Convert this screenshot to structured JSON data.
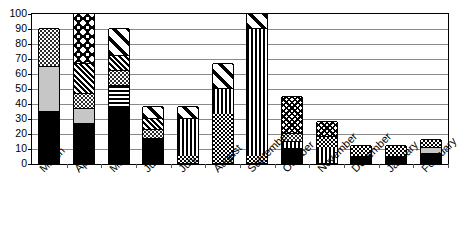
{
  "chart_data": {
    "type": "bar",
    "subtype": "stacked-vertical",
    "title": "",
    "subtitle": "",
    "xlabel": "",
    "ylabel": "",
    "ylim": [
      0,
      100
    ],
    "yticks": [
      0,
      10,
      20,
      30,
      40,
      50,
      60,
      70,
      80,
      90,
      100
    ],
    "ytick_labels": [
      "0",
      "10",
      "20",
      "30",
      "40",
      "50",
      "60",
      "70",
      "80",
      "90",
      "100"
    ],
    "grid": true,
    "grid_axis": "y",
    "legend": false,
    "legend_position": "none",
    "annotations": [],
    "categories": [
      "March",
      "April",
      "May",
      "June",
      "July",
      "August",
      "September",
      "October",
      "November",
      "December",
      "January",
      "February"
    ],
    "series": [
      {
        "name": "segment-1",
        "pattern": "solid-black",
        "values": [
          35,
          27,
          38,
          17,
          5,
          33,
          5,
          10,
          10,
          5,
          5,
          7
        ]
      },
      {
        "name": "segment-2",
        "pattern": "light-gray",
        "values": [
          30,
          10,
          14,
          6,
          25,
          17,
          85,
          5,
          8,
          7,
          7,
          4
        ]
      },
      {
        "name": "segment-3",
        "pattern": "fine-dots",
        "values": [
          25,
          10,
          10,
          7,
          8,
          17,
          10,
          5,
          10,
          0,
          0,
          5
        ]
      },
      {
        "name": "segment-4",
        "pattern": "diagonal-hatch",
        "values": [
          0,
          20,
          10,
          8,
          0,
          0,
          0,
          25,
          0,
          0,
          0,
          0
        ]
      },
      {
        "name": "segment-5",
        "pattern": "star-burst",
        "values": [
          0,
          33,
          18,
          0,
          0,
          0,
          0,
          0,
          0,
          0,
          0,
          0
        ]
      }
    ],
    "totals": [
      90,
      100,
      90,
      38,
      38,
      67,
      100,
      45,
      28,
      12,
      12,
      16
    ],
    "stacks": [
      {
        "category": "March",
        "total": 90,
        "segments": [
          {
            "from": 0,
            "to": 35,
            "pattern": "p-black"
          },
          {
            "from": 35,
            "to": 65,
            "pattern": "p-lightgray"
          },
          {
            "from": 65,
            "to": 90,
            "pattern": "p-dots"
          }
        ]
      },
      {
        "category": "April",
        "total": 100,
        "segments": [
          {
            "from": 0,
            "to": 27,
            "pattern": "p-black"
          },
          {
            "from": 27,
            "to": 37,
            "pattern": "p-lightgray"
          },
          {
            "from": 37,
            "to": 47,
            "pattern": "p-dots"
          },
          {
            "from": 47,
            "to": 67,
            "pattern": "p-diag-dense"
          },
          {
            "from": 67,
            "to": 100,
            "pattern": "p-star"
          }
        ]
      },
      {
        "category": "May",
        "total": 90,
        "segments": [
          {
            "from": 0,
            "to": 38,
            "pattern": "p-black"
          },
          {
            "from": 38,
            "to": 52,
            "pattern": "p-hstripe"
          },
          {
            "from": 52,
            "to": 62,
            "pattern": "p-dots"
          },
          {
            "from": 62,
            "to": 72,
            "pattern": "p-diag-dense"
          },
          {
            "from": 72,
            "to": 90,
            "pattern": "p-diag-wide"
          }
        ]
      },
      {
        "category": "June",
        "total": 38,
        "segments": [
          {
            "from": 0,
            "to": 17,
            "pattern": "p-black"
          },
          {
            "from": 17,
            "to": 23,
            "pattern": "p-dots"
          },
          {
            "from": 23,
            "to": 30,
            "pattern": "p-diag-dense"
          },
          {
            "from": 30,
            "to": 38,
            "pattern": "p-diag-wide"
          }
        ]
      },
      {
        "category": "July",
        "total": 38,
        "segments": [
          {
            "from": 0,
            "to": 5,
            "pattern": "p-checker"
          },
          {
            "from": 5,
            "to": 30,
            "pattern": "p-vstripe"
          },
          {
            "from": 30,
            "to": 38,
            "pattern": "p-diag-wide"
          }
        ]
      },
      {
        "category": "August",
        "total": 67,
        "segments": [
          {
            "from": 0,
            "to": 33,
            "pattern": "p-checker"
          },
          {
            "from": 33,
            "to": 50,
            "pattern": "p-vstripe"
          },
          {
            "from": 50,
            "to": 67,
            "pattern": "p-diag-wide"
          }
        ]
      },
      {
        "category": "September",
        "total": 100,
        "segments": [
          {
            "from": 0,
            "to": 5,
            "pattern": "p-checker"
          },
          {
            "from": 5,
            "to": 90,
            "pattern": "p-vstripe"
          },
          {
            "from": 90,
            "to": 100,
            "pattern": "p-diag-wide"
          }
        ]
      },
      {
        "category": "October",
        "total": 45,
        "segments": [
          {
            "from": 0,
            "to": 10,
            "pattern": "p-black"
          },
          {
            "from": 10,
            "to": 15,
            "pattern": "p-vstripe"
          },
          {
            "from": 15,
            "to": 20,
            "pattern": "p-dots"
          },
          {
            "from": 20,
            "to": 45,
            "pattern": "p-crosshatch"
          }
        ]
      },
      {
        "category": "November",
        "total": 28,
        "segments": [
          {
            "from": 0,
            "to": 10,
            "pattern": "p-vstripe"
          },
          {
            "from": 10,
            "to": 18,
            "pattern": "p-checker"
          },
          {
            "from": 18,
            "to": 28,
            "pattern": "p-crosshatch"
          }
        ]
      },
      {
        "category": "December",
        "total": 12,
        "segments": [
          {
            "from": 0,
            "to": 5,
            "pattern": "p-black"
          },
          {
            "from": 5,
            "to": 12,
            "pattern": "p-checker"
          }
        ]
      },
      {
        "category": "January",
        "total": 12,
        "segments": [
          {
            "from": 0,
            "to": 5,
            "pattern": "p-black"
          },
          {
            "from": 5,
            "to": 12,
            "pattern": "p-checker"
          }
        ]
      },
      {
        "category": "February",
        "total": 16,
        "segments": [
          {
            "from": 0,
            "to": 7,
            "pattern": "p-black"
          },
          {
            "from": 7,
            "to": 11,
            "pattern": "p-lightgray"
          },
          {
            "from": 11,
            "to": 16,
            "pattern": "p-checker"
          }
        ]
      }
    ],
    "colors": {
      "axis": "#000000",
      "grid": "#8a8a8a",
      "solid_fill": "#000000",
      "light_gray_fill": "#c6c6c6",
      "background": "#ffffff"
    }
  }
}
